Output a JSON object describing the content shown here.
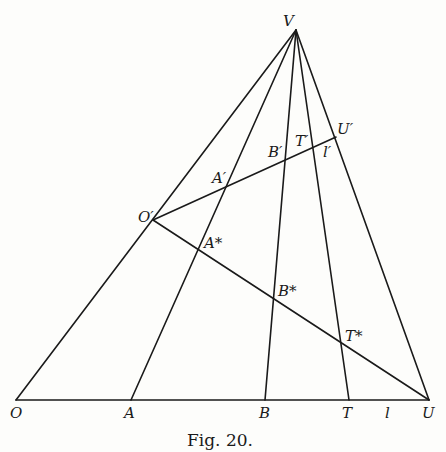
{
  "figure": {
    "caption": "Fig. 20.",
    "points": {
      "V": {
        "label": "V",
        "x": 296,
        "y": 30
      },
      "O": {
        "label": "O",
        "x": 16,
        "y": 400
      },
      "A": {
        "label": "A",
        "x": 131,
        "y": 400
      },
      "B": {
        "label": "B",
        "x": 265,
        "y": 400
      },
      "T": {
        "label": "T",
        "x": 349,
        "y": 400
      },
      "U": {
        "label": "U",
        "x": 429,
        "y": 400
      },
      "Op": {
        "label": "O′",
        "x": 153,
        "y": 220
      },
      "Ap": {
        "label": "A′",
        "x": 226,
        "y": 187
      },
      "Bp": {
        "label": "B′",
        "x": 284,
        "y": 160
      },
      "Tp": {
        "label": "T′",
        "x": 312,
        "y": 148
      },
      "Up": {
        "label": "U′",
        "x": 336,
        "y": 137
      },
      "As": {
        "label": "A*",
        "x": 199,
        "y": 249
      },
      "Bs": {
        "label": "B*",
        "x": 273,
        "y": 297
      },
      "Ts": {
        "label": "T*",
        "x": 341,
        "y": 342
      }
    },
    "line_labels": {
      "l": "l",
      "lp": "l′"
    }
  }
}
